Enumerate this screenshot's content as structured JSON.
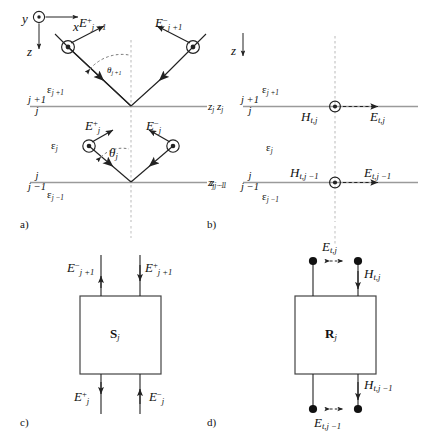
{
  "figure": {
    "type": "scientific-diagram",
    "background": "#ffffff",
    "line_color": "#222222",
    "interface_color": "#8a8a8a",
    "dash_color": "#b9b9b9",
    "panels": [
      {
        "key": "a",
        "label": "a)",
        "caption": "Upward and downward plane-wave amplitudes in layers j+1, j, j-1"
      },
      {
        "key": "b",
        "label": "b)",
        "caption": "Tangential field components at interfaces z_j and z_{j-1}"
      },
      {
        "key": "c",
        "label": "c)",
        "caption": "Scattering-matrix two-port S_j"
      },
      {
        "key": "d",
        "label": "d)",
        "caption": "Transfer/impedance-matrix two-port R_j"
      }
    ]
  },
  "axes": {
    "panel_a": {
      "y_label": "y",
      "y_marker": "out-of-page-dot",
      "x_label": "x",
      "z_label": "z"
    },
    "panel_b": {
      "z_label": "z"
    }
  },
  "panel_a": {
    "permittivity_upper": {
      "symbol": "ε",
      "sub": "j +1"
    },
    "permittivity_middle": {
      "symbol": "ε",
      "sub": "j"
    },
    "permittivity_lower": {
      "symbol": "ε",
      "sub": "j −1"
    },
    "interface_top": {
      "above": "j +1",
      "below": "j",
      "z_label": "z",
      "z_sub": "j"
    },
    "interface_bottom": {
      "above": "j",
      "below": "j −1",
      "z_label": "z",
      "z_sub": "j −1"
    },
    "field_up_left": {
      "symbol": "E",
      "sup": "+",
      "sub": "j +1"
    },
    "field_up_right": {
      "symbol": "E",
      "sup": "−",
      "sub": "j +1"
    },
    "field_low_left": {
      "symbol": "E",
      "sup": "+",
      "sub": "j"
    },
    "field_low_right": {
      "symbol": "E",
      "sup": "−",
      "sub": "j"
    },
    "angle_upper": {
      "symbol": "θ",
      "sub": "j +1"
    },
    "angle_lower": {
      "symbol": "θ",
      "sub": "j"
    }
  },
  "panel_b": {
    "permittivity_upper": {
      "symbol": "ε",
      "sub": "j +1"
    },
    "permittivity_middle": {
      "symbol": "ε",
      "sub": "j"
    },
    "permittivity_lower": {
      "symbol": "ε",
      "sub": "j −1"
    },
    "interface_top": {
      "above": "j +1",
      "below": "j",
      "z_label": "z",
      "z_sub": "j"
    },
    "interface_bottom": {
      "above": "j",
      "below": "j −1",
      "z_label": "z",
      "z_sub": "j −1"
    },
    "h_top": {
      "symbol": "H",
      "sub": "t,j"
    },
    "e_top": {
      "symbol": "E",
      "sub": "t,j"
    },
    "h_bottom": {
      "symbol": "H",
      "sub": "t,j −1"
    },
    "e_bottom": {
      "symbol": "E",
      "sub": "t,j −1"
    }
  },
  "panel_c": {
    "box_symbol": "S",
    "box_sub": "j",
    "port_top_left": {
      "symbol": "E",
      "sup": "−",
      "sub": "j +1",
      "direction": "out-up"
    },
    "port_top_right": {
      "symbol": "E",
      "sup": "+",
      "sub": "j +1",
      "direction": "in-down"
    },
    "port_bottom_left": {
      "symbol": "E",
      "sup": "+",
      "sub": "j",
      "direction": "out-down"
    },
    "port_bottom_right": {
      "symbol": "E",
      "sup": "−",
      "sub": "j",
      "direction": "in-up"
    }
  },
  "panel_d": {
    "box_symbol": "R",
    "box_sub": "j",
    "port_top_voltage": {
      "symbol": "E",
      "sub": "t,j",
      "direction": "across"
    },
    "port_top_current": {
      "symbol": "H",
      "sub": "t,j",
      "direction": "down"
    },
    "port_bottom_voltage": {
      "symbol": "E",
      "sub": "t,j −1",
      "direction": "across"
    },
    "port_bottom_current": {
      "symbol": "H",
      "sub": "t,j −1",
      "direction": "down"
    }
  }
}
